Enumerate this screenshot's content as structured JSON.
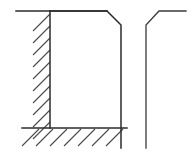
{
  "figure": {
    "type": "engineering-line-drawing",
    "caption": "",
    "canvas": {
      "width": 192,
      "height": 155,
      "background": "#ffffff"
    },
    "colors": {
      "outline": "#2b2b2b",
      "hatch": "#4a4a4a",
      "profile": "#3a3a3a",
      "fill": "#ffffff"
    },
    "geometry": {
      "wall_top_line": {
        "x1": 16,
        "y1": 11,
        "x2": 107,
        "y2": 11
      },
      "wall_vertical": {
        "x1": 50,
        "y1": 11,
        "x2": 50,
        "y2": 128
      },
      "floor_line": {
        "x1": 22,
        "y1": 128,
        "x2": 127,
        "y2": 128
      },
      "block_top": {
        "x1": 50,
        "y1": 11,
        "x2": 107,
        "y2": 11
      },
      "block_chamfer": {
        "x1": 107,
        "y1": 11,
        "x2": 121,
        "y2": 25
      },
      "block_right": {
        "x1": 121,
        "y1": 25,
        "x2": 121,
        "y2": 148
      },
      "block_bottom": {
        "x1": 50,
        "y1": 128,
        "x2": 121,
        "y2": 128
      },
      "profile_vertical": {
        "x1": 146,
        "y1": 148,
        "x2": 146,
        "y2": 25
      },
      "profile_chamfer": {
        "x1": 146,
        "y1": 25,
        "x2": 159,
        "y2": 11
      },
      "profile_top": {
        "x1": 159,
        "y1": 11,
        "x2": 186,
        "y2": 11
      }
    },
    "hatching": {
      "wall": {
        "label": "wall-hatching-left",
        "angle_degrees": 45,
        "direction": "up-right",
        "count": 10,
        "spacing_px": 12.5,
        "length_px": 18
      },
      "floor": {
        "label": "floor-hatching-bottom",
        "angle_degrees": 45,
        "direction": "up-right",
        "count": 7,
        "spacing_px": 14,
        "length_px": 18
      }
    },
    "labels": []
  }
}
